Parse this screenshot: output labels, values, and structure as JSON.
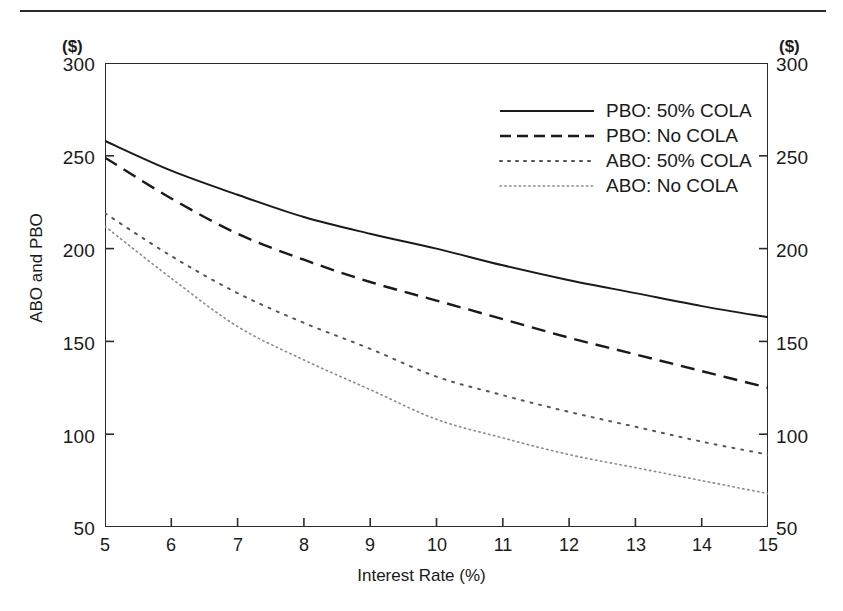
{
  "chart_data": {
    "type": "line",
    "title": "",
    "xlabel": "Interest Rate (%)",
    "ylabel": "ABO and PBO",
    "y_unit_caption": "($)",
    "xlim": [
      5,
      15
    ],
    "ylim": [
      50,
      300
    ],
    "grid": false,
    "legend_position": "upper-right-inside",
    "x_ticks": [
      "5",
      "6",
      "7",
      "8",
      "9",
      "10",
      "11",
      "12",
      "13",
      "14",
      "15"
    ],
    "y_ticks": [
      "50",
      "100",
      "150",
      "200",
      "250",
      "300"
    ],
    "y_ticks_right": [
      "50",
      "100",
      "150",
      "200",
      "250",
      "300"
    ],
    "x": [
      5,
      6,
      7,
      8,
      9,
      10,
      11,
      12,
      13,
      14,
      15
    ],
    "series": [
      {
        "name": "PBO: 50% COLA",
        "style": "solid",
        "color": "#1a1a1a",
        "values": [
          258,
          242,
          229,
          217,
          208,
          200,
          191,
          183,
          176,
          169,
          163
        ]
      },
      {
        "name": "PBO: No COLA",
        "style": "dashed",
        "color": "#1a1a1a",
        "values": [
          249,
          227,
          208,
          194,
          182,
          172,
          162,
          152,
          143,
          134,
          125
        ]
      },
      {
        "name": "ABO: 50% COLA",
        "style": "dotted",
        "color": "#555555",
        "values": [
          219,
          196,
          176,
          160,
          146,
          131,
          121,
          112,
          104,
          96,
          89
        ]
      },
      {
        "name": "ABO: No COLA",
        "style": "fine-dotted",
        "color": "#8a8a8a",
        "values": [
          212,
          184,
          158,
          140,
          124,
          108,
          98,
          89,
          82,
          75,
          68
        ]
      }
    ]
  }
}
